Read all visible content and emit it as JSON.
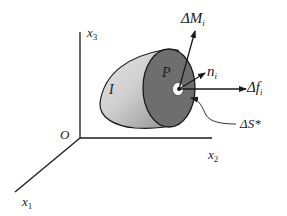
{
  "diagram": {
    "axes": {
      "origin": "O",
      "x1": {
        "base": "x",
        "sub": "1"
      },
      "x2": {
        "base": "x",
        "sub": "2"
      },
      "x3": {
        "base": "x",
        "sub": "3"
      }
    },
    "body_label": "I",
    "point_label": "P",
    "vectors": {
      "moment": {
        "base": "ΔM",
        "sub": "i"
      },
      "normal": {
        "base": "n",
        "sub": "i"
      },
      "force": {
        "base": "Δf",
        "sub": "i"
      }
    },
    "surface_label": "ΔS*",
    "colors": {
      "line": "#1a1a1a",
      "body_light": "#d9d9d9",
      "body_mid": "#a6a6a6",
      "face_dark": "#6e6e6e",
      "hole": "#ffffff"
    }
  }
}
